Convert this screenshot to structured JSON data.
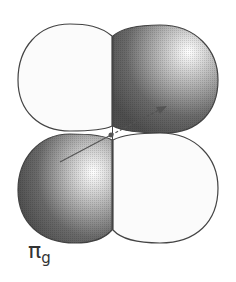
{
  "diagram": {
    "label": {
      "symbol": "π",
      "subscript": "g"
    },
    "lobes": [
      {
        "name": "top-left",
        "phase": "positive",
        "fill": "light"
      },
      {
        "name": "top-right",
        "phase": "negative",
        "fill": "dark"
      },
      {
        "name": "bottom-left",
        "phase": "negative",
        "fill": "dark"
      },
      {
        "name": "bottom-right",
        "phase": "positive",
        "fill": "light"
      }
    ],
    "axis_arrow": {
      "style": "solid-then-dashed",
      "direction": "lower-left to upper-right"
    },
    "colors": {
      "outline": "#444444",
      "light_lobe": "#fafafa",
      "dark_lobe": "#5a5a5a",
      "highlight": "#ffffff"
    }
  }
}
